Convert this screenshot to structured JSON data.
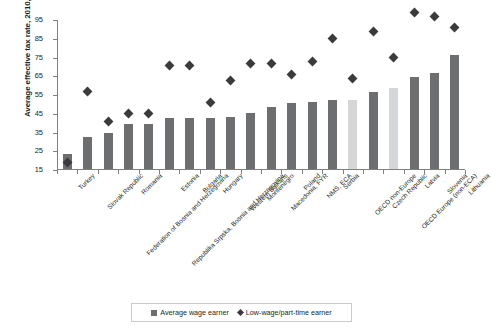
{
  "chart_data": {
    "type": "bar",
    "title": "",
    "subtitle": "",
    "xlabel": "",
    "ylabel": "Average effective tax rate, 2010, percent",
    "ylim": [
      15,
      95
    ],
    "ytick_step": 10,
    "yticks": [
      15,
      25,
      35,
      45,
      55,
      65,
      75,
      85,
      95
    ],
    "grid": false,
    "legend_position": "bottom",
    "categories": [
      "Turkey",
      "Slovak Republic",
      "Federation of Bosnia and Herzegovina",
      "Romania",
      "Republika Srpska, Bosnia and Herzegovina",
      "Estonia",
      "Bulgaria",
      "Hungary",
      "Western Balkans",
      "Montenegro",
      "Macedonia, FYR",
      "Poland",
      "NMS, ECA",
      "Serbia",
      "OECD non-Europe",
      "Czech Republic",
      "OECD Europe (non-ECA)",
      "Latvia",
      "Slovenia",
      "Lithuania"
    ],
    "series": [
      {
        "name": "Average wage earner",
        "type": "bar",
        "color": "#6d6e70",
        "highlight_color": "#d5d6d8",
        "values": [
          23,
          32,
          34,
          39,
          39,
          42,
          42,
          42,
          43,
          45,
          48,
          50,
          51,
          52,
          52,
          56,
          58,
          64,
          66,
          76
        ]
      },
      {
        "name": "Low-wage/part-time earner",
        "type": "scatter",
        "marker": "diamond",
        "color": "#3b3b3d",
        "values": [
          19,
          57,
          41,
          45,
          45,
          71,
          71,
          51,
          63,
          72,
          72,
          66,
          73,
          85,
          64,
          89,
          75,
          99,
          97,
          91
        ]
      }
    ],
    "highlighted_categories": [
      "OECD non-Europe",
      "OECD Europe (non-ECA)"
    ],
    "legend": [
      {
        "label": "Average wage earner",
        "marker": "square"
      },
      {
        "label": "Low-wage/part-time earner",
        "marker": "diamond"
      }
    ]
  }
}
